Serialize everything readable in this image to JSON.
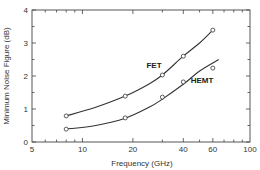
{
  "chart_data": {
    "type": "scatter",
    "title": "",
    "xlabel": "Frequency (GHz)",
    "ylabel": "Minimum Noise Figure (dB)",
    "xscale": "log",
    "xlim": [
      5,
      100
    ],
    "ylim": [
      0,
      4
    ],
    "xticks": [
      5,
      10,
      20,
      40,
      60,
      100
    ],
    "yticks": [
      0,
      1,
      2,
      3,
      4
    ],
    "grid": false,
    "legend": "inline labels",
    "series": [
      {
        "name": "FET",
        "label_pos": {
          "x": 154,
          "y": 68
        },
        "points": [
          {
            "x": 8,
            "y": 0.79
          },
          {
            "x": 18,
            "y": 1.39
          },
          {
            "x": 30,
            "y": 2.03
          },
          {
            "x": 40,
            "y": 2.6
          },
          {
            "x": 60,
            "y": 3.39
          }
        ],
        "fit": [
          [
            8,
            0.79
          ],
          [
            12,
            1.05
          ],
          [
            18,
            1.39
          ],
          [
            25,
            1.76
          ],
          [
            30,
            2.03
          ],
          [
            40,
            2.6
          ],
          [
            50,
            3.0
          ],
          [
            60,
            3.39
          ]
        ]
      },
      {
        "name": "HEMT",
        "label_pos": {
          "x": 202,
          "y": 83
        },
        "points": [
          {
            "x": 8,
            "y": 0.39
          },
          {
            "x": 18,
            "y": 0.73
          },
          {
            "x": 30,
            "y": 1.36
          },
          {
            "x": 40,
            "y": 1.82
          },
          {
            "x": 60,
            "y": 2.24
          }
        ],
        "fit": [
          [
            8,
            0.39
          ],
          [
            12,
            0.5
          ],
          [
            18,
            0.72
          ],
          [
            25,
            1.05
          ],
          [
            30,
            1.3
          ],
          [
            40,
            1.75
          ],
          [
            50,
            2.15
          ],
          [
            65,
            2.5
          ]
        ]
      }
    ]
  }
}
